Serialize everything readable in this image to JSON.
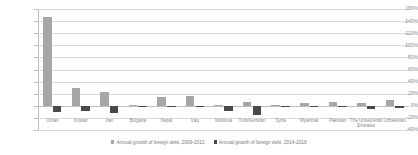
{
  "chart_data": {
    "type": "bar",
    "title": "",
    "xlabel": "",
    "ylabel": "",
    "ylim": [
      -40,
      160
    ],
    "ytick_step": 20,
    "grid": true,
    "legend_position": "bottom",
    "categories": [
      "Oman",
      "Kuwait",
      "Iran",
      "Bulgaria",
      "Nepal",
      "Iraq",
      "Moldova",
      "Turkmenistan",
      "Syria",
      "Myanmar",
      "Pakistan",
      "The United Arab Emirates",
      "Uzbekistan"
    ],
    "series": [
      {
        "name": "Annual growth of foreign debt, 2009-2013",
        "color": "#a6a6a6",
        "values": [
          147,
          30,
          22,
          2,
          15,
          16,
          1,
          7,
          1,
          5,
          7,
          4,
          10
        ]
      },
      {
        "name": "Annual growth of foreign debt, 2014-2018",
        "color": "#494949",
        "values": [
          -11,
          -9,
          -12,
          -1,
          -1,
          -1,
          -9,
          -16,
          -2,
          -1,
          -2,
          -5,
          -4
        ]
      }
    ],
    "ytick_labels": [
      "160%",
      "140%",
      "120%",
      "100%",
      "80%",
      "60%",
      "40%",
      "20%",
      "0%",
      "-20%",
      "-40%"
    ]
  }
}
